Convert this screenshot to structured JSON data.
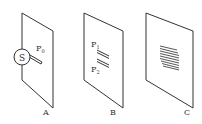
{
  "diagram": {
    "panels": [
      {
        "id": "A",
        "label": "A",
        "source_label": "S",
        "slit_label": "P",
        "slit_subscript": "0"
      },
      {
        "id": "B",
        "label": "B",
        "slits": [
          {
            "label": "P",
            "subscript": "1"
          },
          {
            "label": "P",
            "subscript": "2"
          }
        ]
      },
      {
        "id": "C",
        "label": "C",
        "fringe_count": 9
      }
    ],
    "colors": {
      "stroke": "#333333",
      "background": "#ffffff"
    }
  }
}
